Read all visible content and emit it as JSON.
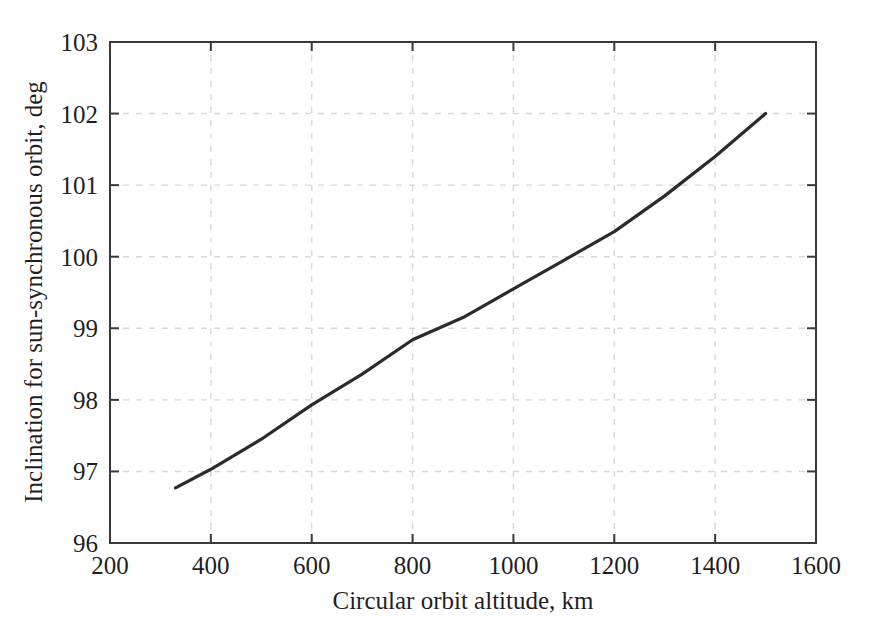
{
  "chart_data": {
    "type": "line",
    "title": "",
    "xlabel": "Circular orbit altitude, km",
    "ylabel": "Inclination for sun-synchronous orbit, deg",
    "xlim": [
      200,
      1600
    ],
    "ylim": [
      96,
      103
    ],
    "xticks": [
      200,
      400,
      600,
      800,
      1000,
      1200,
      1400,
      1600
    ],
    "yticks": [
      96,
      97,
      98,
      99,
      100,
      101,
      102,
      103
    ],
    "xtick_labels": [
      "200",
      "400",
      "600",
      "800",
      "1000",
      "1200",
      "1400",
      "1600"
    ],
    "ytick_labels": [
      "96",
      "97",
      "98",
      "99",
      "100",
      "101",
      "102",
      "103"
    ],
    "grid": true,
    "grid_style": "dashed",
    "grid_color": "#d8d8d8",
    "legend": "none",
    "line_color": "#2b2b2b",
    "line_width": 3.2,
    "series": [
      {
        "name": "Sun-synchronous inclination",
        "x": [
          330,
          400,
          500,
          600,
          700,
          800,
          900,
          1000,
          1100,
          1200,
          1300,
          1400,
          1500
        ],
        "y": [
          96.77,
          97.03,
          97.45,
          97.93,
          98.36,
          98.84,
          99.15,
          99.55,
          99.95,
          100.35,
          100.85,
          101.4,
          102.0
        ]
      }
    ]
  },
  "axis": {
    "x_axis_name": "Circular orbit altitude",
    "x_axis_unit": "km",
    "y_axis_name": "Inclination for sun-synchronous orbit",
    "y_axis_unit": "deg"
  }
}
